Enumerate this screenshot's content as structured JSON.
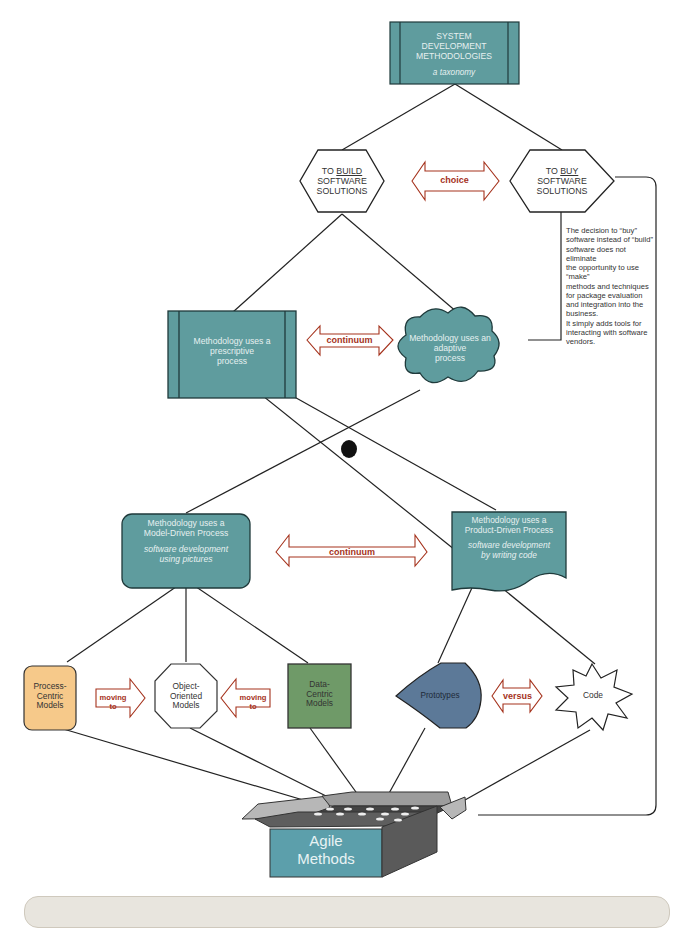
{
  "colors": {
    "teal": "#5f9c9e",
    "teal_dark_stripe": "#1f3a3b",
    "arrow_red": "#a5321c",
    "process_orange": "#f6c98a",
    "data_green": "#6f9a68",
    "prototype_blue": "#5c7998",
    "box_teal": "#5c9fab"
  },
  "title": {
    "line1": "SYSTEM",
    "line2": "DEVELOPMENT",
    "line3": "METHODOLOGIES",
    "subtitle": "a taxonomy"
  },
  "build_node": {
    "line1_prefix": "TO ",
    "line1_emph": "BUILD",
    "line2": "SOFTWARE",
    "line3": "SOLUTIONS"
  },
  "buy_node": {
    "line1_prefix": "TO ",
    "line1_emph": "BUY",
    "line2": "SOFTWARE",
    "line3": "SOLUTIONS"
  },
  "arrows": {
    "choice": "choice",
    "continuum_top": "continuum",
    "continuum_mid": "continuum",
    "moving_to_left": "moving to",
    "moving_to_right": "moving to",
    "versus": "versus"
  },
  "buy_note": {
    "lines": [
      "The decision to “buy”",
      "software instead of “build”",
      "software does not",
      "eliminate",
      "the opportunity to use",
      "“make”",
      "methods and techniques",
      "for package evaluation",
      "and integration into the",
      "business.",
      "It simply adds tools for",
      "interacting with software",
      "vendors."
    ]
  },
  "prescriptive": {
    "line1": "Methodology uses a",
    "line2": "prescriptive",
    "line3": "process"
  },
  "adaptive": {
    "line1": "Methodology uses an",
    "line2": "adaptive",
    "line3": "process"
  },
  "model_driven": {
    "line1": "Methodology uses a",
    "line2": "Model-Driven Process",
    "line3": "software development",
    "line4": "using pictures"
  },
  "product_driven": {
    "line1": "Methodology uses a",
    "line2": "Product-Driven Process",
    "line3": "software development",
    "line4": "by writing code"
  },
  "leaves": {
    "process_centric": {
      "line1": "Process-",
      "line2": "Centric",
      "line3": "Models"
    },
    "object_oriented": {
      "line1": "Object-",
      "line2": "Oriented",
      "line3": "Models"
    },
    "data_centric": {
      "line1": "Data-",
      "line2": "Centric",
      "line3": "Models"
    },
    "prototypes": "Prototypes",
    "code": "Code"
  },
  "agile_box": {
    "line1": "Agile",
    "line2": "Methods"
  }
}
